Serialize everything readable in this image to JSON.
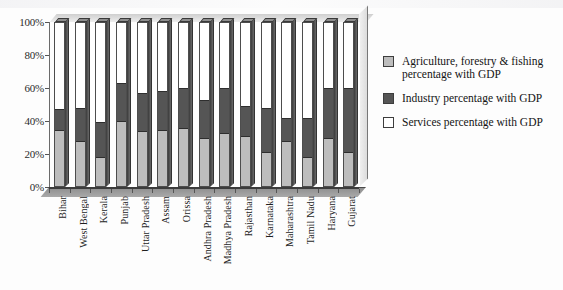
{
  "chart_data": {
    "type": "bar",
    "subtype": "stacked-100-percent-3d",
    "title": "",
    "xlabel": "",
    "ylabel": "",
    "ylim": [
      0,
      100
    ],
    "ytick_labels": [
      "0%",
      "20%",
      "40%",
      "60%",
      "80%",
      "100%"
    ],
    "ytick_values": [
      0,
      20,
      40,
      60,
      80,
      100
    ],
    "grid": false,
    "legend_position": "right",
    "categories": [
      "Bihar",
      "West Bengal",
      "Kerala",
      "Punjab",
      "Uttar Pradesh",
      "Assam",
      "Orissa",
      "Andhra Pradesh",
      "Madhya Pradesh",
      "Rajasthan",
      "Karnataka",
      "Maharashtra",
      "Tamil Nadu",
      "Haryana",
      "Gujarat"
    ],
    "series": [
      {
        "name": "Agriculture, forestry & fishing percentage with GDP",
        "color": "#bdbdbd",
        "values": [
          34,
          27,
          17,
          39,
          33,
          34,
          35,
          29,
          32,
          30,
          20,
          27,
          17,
          29,
          20
        ]
      },
      {
        "name": "Industry percentage with GDP",
        "color": "#555555",
        "values": [
          13,
          21,
          22,
          24,
          24,
          24,
          25,
          24,
          28,
          19,
          28,
          15,
          25,
          31,
          40
        ]
      },
      {
        "name": "Services percentage with GDP",
        "color": "#ffffff",
        "values": [
          53,
          52,
          61,
          37,
          43,
          42,
          40,
          47,
          40,
          51,
          52,
          58,
          58,
          40,
          40
        ]
      }
    ]
  },
  "legend": {
    "items": [
      {
        "label": "Agriculture, forestry & fishing percentage with GDP",
        "color": "#bdbdbd",
        "swatch": "agri"
      },
      {
        "label": "Industry percentage with GDP",
        "color": "#555555",
        "swatch": "ind"
      },
      {
        "label": "Services percentage with GDP",
        "color": "#ffffff",
        "swatch": "serv"
      }
    ]
  }
}
